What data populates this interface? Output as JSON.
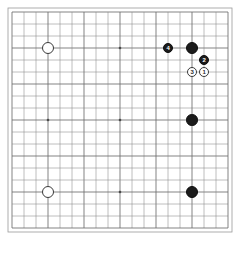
{
  "board": {
    "kind": "go-board",
    "size": 19,
    "columns": 19,
    "rows": 19,
    "grid_color": "#8a8a8a",
    "grid_major_color": "#6e6e6e",
    "border_color": "#9a9a9a",
    "background_color": "#ffffff",
    "star_point_color": "#4a4a4a",
    "origin_x": 12,
    "origin_y": 12,
    "spacing": 12.0,
    "star_points": [
      {
        "col": 4,
        "row": 4
      },
      {
        "col": 10,
        "row": 4
      },
      {
        "col": 16,
        "row": 4
      },
      {
        "col": 4,
        "row": 10
      },
      {
        "col": 10,
        "row": 10
      },
      {
        "col": 16,
        "row": 10
      },
      {
        "col": 4,
        "row": 16
      },
      {
        "col": 10,
        "row": 16
      },
      {
        "col": 16,
        "row": 16
      }
    ]
  },
  "stones": [
    {
      "id": "w-upper-left",
      "color": "white",
      "col": 4,
      "row": 4,
      "label": "",
      "radius": 6.0
    },
    {
      "id": "b-move-4",
      "color": "black",
      "col": 14,
      "row": 4,
      "label": "4",
      "radius": 5.4
    },
    {
      "id": "b-corner-top",
      "color": "black",
      "col": 16,
      "row": 4,
      "label": "",
      "radius": 6.2
    },
    {
      "id": "b-move-2",
      "color": "black",
      "col": 17,
      "row": 5,
      "label": "2",
      "radius": 5.2
    },
    {
      "id": "w-move-3",
      "color": "white",
      "col": 16,
      "row": 6,
      "label": "3",
      "radius": 5.2
    },
    {
      "id": "w-move-1",
      "color": "white",
      "col": 17,
      "row": 6,
      "label": "1",
      "radius": 5.2
    },
    {
      "id": "b-right-middle",
      "color": "black",
      "col": 16,
      "row": 10,
      "label": "",
      "radius": 5.8
    },
    {
      "id": "w-lower-left",
      "color": "white",
      "col": 4,
      "row": 16,
      "label": "",
      "radius": 6.0
    },
    {
      "id": "b-lower-right",
      "color": "black",
      "col": 16,
      "row": 16,
      "label": "",
      "radius": 6.0
    }
  ],
  "counts": {
    "black_stones": 5,
    "white_stones": 4,
    "numbered_moves": 4
  }
}
